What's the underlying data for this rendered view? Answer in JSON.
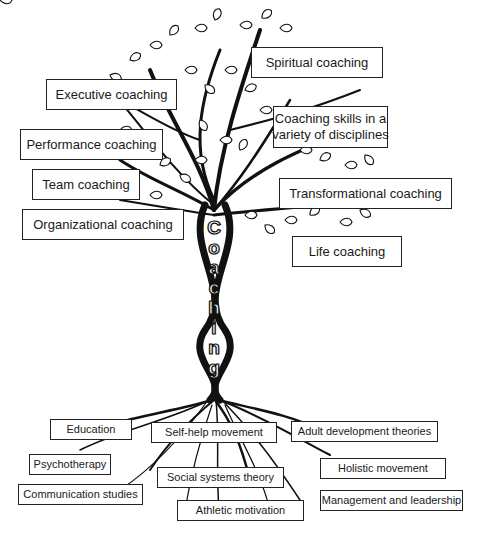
{
  "title": "Coaching",
  "trunk_letters": [
    "C",
    "o",
    "a",
    "c",
    "h",
    "i",
    "n",
    "g"
  ],
  "branches": {
    "executive": "Executive coaching",
    "performance": "Performance coaching",
    "team": "Team coaching",
    "organizational": "Organizational coaching",
    "spiritual": "Spiritual coaching",
    "skills_line1": "Coaching skills in a",
    "skills_line2": "variety of disciplines",
    "transformational": "Transformational coaching",
    "life": "Life coaching"
  },
  "roots": {
    "education": "Education",
    "self_help": "Self-help movement",
    "adult_development": "Adult development theories",
    "psychotherapy": "Psychotherapy",
    "holistic": "Holistic movement",
    "social_systems": "Social systems theory",
    "communication": "Communication studies",
    "management": "Management and leadership",
    "athletic": "Athletic motivation"
  },
  "colors": {
    "ink": "#1a1a1a",
    "background": "#ffffff"
  }
}
